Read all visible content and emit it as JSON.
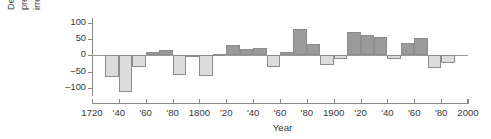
{
  "chart_data": {
    "type": "bar",
    "title": "",
    "subtitle": "",
    "xlabel": "Year",
    "ylabel": "Decade average annual precipitation irregularities (mm)",
    "ylabel_lines": [
      "Decade average annual",
      "precipitation",
      "irregularities (mm)"
    ],
    "xlim": [
      1720,
      2000
    ],
    "ylim": [
      -125,
      115
    ],
    "grid": false,
    "legend": "none",
    "yticks": [
      100,
      50,
      0,
      -50,
      -100
    ],
    "ytick_labels": [
      "100",
      "50",
      "0",
      "–50",
      "–100"
    ],
    "xticks": [
      1720,
      1740,
      1760,
      1780,
      1800,
      1820,
      1840,
      1860,
      1880,
      1900,
      1920,
      1940,
      1960,
      1980,
      2000
    ],
    "xtick_labels": [
      "1720",
      "'40",
      "'60",
      "'80",
      "1800",
      "'20",
      "'40",
      "'60",
      "'80",
      "1900",
      "'20",
      "'40",
      "'60",
      "'80",
      "2000"
    ],
    "bar_width_years": 10,
    "colors": {
      "positive": "#9a9a9a",
      "negative": "#dcdcdc",
      "bar_edge": "#8d8d8d",
      "axis": "#8a8a8a",
      "text": "#3a3a3a",
      "background": "#ffffff"
    },
    "categories": [
      "1730s",
      "1740s",
      "1750s",
      "1760s",
      "1770s",
      "1780s",
      "1790s",
      "1800s",
      "1810s",
      "1820s",
      "1830s",
      "1840s",
      "1850s",
      "1860s",
      "1870s",
      "1880s",
      "1890s",
      "1900s",
      "1910s",
      "1920s",
      "1930s",
      "1940s",
      "1950s",
      "1960s",
      "1970s",
      "1980s"
    ],
    "x": [
      1730,
      1740,
      1750,
      1760,
      1770,
      1780,
      1790,
      1800,
      1810,
      1820,
      1830,
      1840,
      1850,
      1860,
      1870,
      1880,
      1890,
      1900,
      1910,
      1920,
      1930,
      1940,
      1950,
      1960,
      1970,
      1980
    ],
    "values": [
      -65,
      -112,
      -36,
      10,
      17,
      -60,
      -5,
      -62,
      5,
      32,
      20,
      24,
      -35,
      10,
      80,
      35,
      -29,
      -12,
      71,
      62,
      56,
      -12,
      38,
      52,
      -40,
      -24
    ]
  }
}
